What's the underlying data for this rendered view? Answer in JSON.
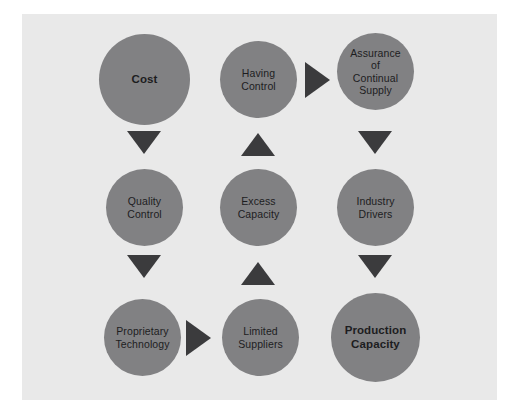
{
  "diagram": {
    "background_color": "#ffffff",
    "panel_color": "#e9e9e9",
    "node_color": "#818183",
    "arrow_color": "#3b3b3d",
    "text_color": "#1d1d1f",
    "nodes": [
      {
        "id": "cost",
        "label": "Cost",
        "column": 1,
        "row": 1,
        "emphasis": true,
        "size": 91,
        "x": 99,
        "y": 34
      },
      {
        "id": "having-control",
        "label": "Having\nControl",
        "column": 2,
        "row": 1,
        "emphasis": false,
        "size": 77,
        "x": 220,
        "y": 41
      },
      {
        "id": "assurance-of-continual-supply",
        "label": "Assurance\nof\nContinual\nSupply",
        "column": 3,
        "row": 1,
        "emphasis": false,
        "size": 77,
        "x": 337,
        "y": 33
      },
      {
        "id": "quality-control",
        "label": "Quality\nControl",
        "column": 1,
        "row": 2,
        "emphasis": false,
        "size": 77,
        "x": 106,
        "y": 169
      },
      {
        "id": "excess-capacity",
        "label": "Excess\nCapacity",
        "column": 2,
        "row": 2,
        "emphasis": false,
        "size": 77,
        "x": 220,
        "y": 169
      },
      {
        "id": "industry-drivers",
        "label": "Industry\nDrivers",
        "column": 3,
        "row": 2,
        "emphasis": false,
        "size": 77,
        "x": 337,
        "y": 169
      },
      {
        "id": "proprietary-technology",
        "label": "Proprietary\nTechnology",
        "column": 1,
        "row": 3,
        "emphasis": false,
        "size": 77,
        "x": 104,
        "y": 299
      },
      {
        "id": "limited-suppliers",
        "label": "Limited\nSuppliers",
        "column": 2,
        "row": 3,
        "emphasis": false,
        "size": 77,
        "x": 222,
        "y": 299
      },
      {
        "id": "production-capacity",
        "label": "Production\nCapacity",
        "column": 3,
        "row": 3,
        "emphasis": true,
        "size": 89,
        "x": 331,
        "y": 293
      }
    ],
    "arrows": [
      {
        "id": "cost-to-quality-control",
        "direction": "down",
        "from": "cost",
        "to": "quality-control",
        "x": 127,
        "y": 131
      },
      {
        "id": "quality-control-to-proprietary-technology",
        "direction": "down",
        "from": "quality-control",
        "to": "proprietary-technology",
        "x": 127,
        "y": 255
      },
      {
        "id": "excess-capacity-to-having-control",
        "direction": "up",
        "from": "excess-capacity",
        "to": "having-control",
        "x": 241,
        "y": 133
      },
      {
        "id": "limited-suppliers-to-excess-capacity",
        "direction": "up",
        "from": "limited-suppliers",
        "to": "excess-capacity",
        "x": 241,
        "y": 262
      },
      {
        "id": "having-control-to-assurance",
        "direction": "right",
        "from": "having-control",
        "to": "assurance-of-continual-supply",
        "x": 305,
        "y": 62
      },
      {
        "id": "assurance-to-industry-drivers",
        "direction": "down",
        "from": "assurance-of-continual-supply",
        "to": "industry-drivers",
        "x": 358,
        "y": 131
      },
      {
        "id": "industry-drivers-to-production-capacity",
        "direction": "down",
        "from": "industry-drivers",
        "to": "production-capacity",
        "x": 358,
        "y": 255
      },
      {
        "id": "proprietary-technology-to-limited-suppliers",
        "direction": "right",
        "from": "proprietary-technology",
        "to": "limited-suppliers",
        "x": 186,
        "y": 320
      }
    ]
  }
}
